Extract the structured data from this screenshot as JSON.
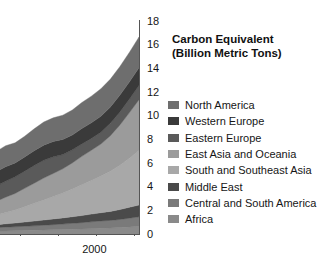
{
  "chart_data": {
    "type": "area",
    "stacked": true,
    "title": "Carbon Equivalent (Billion Metric Tons)",
    "title_line1": "Carbon Equivalent",
    "title_line2": "(Billion Metric Tons)",
    "xlabel": "",
    "ylabel": "Carbon Equivalent (Billion Metric Tons)",
    "ylim": [
      0,
      18
    ],
    "yticks": [
      0,
      2,
      4,
      6,
      8,
      10,
      12,
      14,
      16,
      18
    ],
    "ytick_labels": [
      "0",
      "2",
      "4",
      "6",
      "8",
      "10",
      "12",
      "14",
      "16",
      "18"
    ],
    "y_axis_position": "right",
    "xlim": [
      1970,
      2008
    ],
    "xticks": [
      1975,
      1983,
      1991,
      1999,
      2007
    ],
    "xtick_labels": [
      "",
      "",
      "",
      "2000",
      ""
    ],
    "x_labeled_tick": "2000",
    "grid": false,
    "legend_position": "right",
    "x": [
      1970,
      1972,
      1974,
      1976,
      1978,
      1980,
      1982,
      1984,
      1986,
      1988,
      1990,
      1992,
      1994,
      1996,
      1998,
      2000,
      2002,
      2004,
      2006,
      2008
    ],
    "series": [
      {
        "name": "Africa",
        "color": "#8a8a8a",
        "values": [
          0.15,
          0.17,
          0.19,
          0.21,
          0.24,
          0.26,
          0.28,
          0.3,
          0.32,
          0.34,
          0.36,
          0.38,
          0.4,
          0.42,
          0.45,
          0.48,
          0.51,
          0.55,
          0.6,
          0.65
        ]
      },
      {
        "name": "Central and South America",
        "color": "#7a7a7a",
        "values": [
          0.18,
          0.21,
          0.24,
          0.27,
          0.3,
          0.32,
          0.33,
          0.35,
          0.37,
          0.4,
          0.43,
          0.46,
          0.5,
          0.54,
          0.58,
          0.62,
          0.64,
          0.68,
          0.74,
          0.8
        ]
      },
      {
        "name": "Middle East",
        "color": "#4a4a4a",
        "values": [
          0.1,
          0.13,
          0.16,
          0.2,
          0.24,
          0.28,
          0.32,
          0.36,
          0.4,
          0.44,
          0.48,
          0.52,
          0.56,
          0.6,
          0.65,
          0.7,
          0.76,
          0.84,
          0.92,
          1.0
        ]
      },
      {
        "name": "South and Southeast Asia",
        "color": "#a8a8a8",
        "values": [
          0.35,
          0.45,
          0.55,
          0.68,
          0.82,
          0.95,
          1.1,
          1.3,
          1.5,
          1.7,
          1.9,
          2.1,
          2.35,
          2.6,
          2.85,
          3.1,
          3.4,
          3.75,
          4.15,
          4.6
        ]
      },
      {
        "name": "East Asia and Oceania",
        "color": "#9b9b9b",
        "values": [
          0.55,
          0.7,
          0.85,
          1.0,
          1.15,
          1.3,
          1.4,
          1.55,
          1.7,
          1.85,
          1.95,
          2.05,
          2.2,
          2.4,
          2.55,
          2.7,
          3.0,
          3.4,
          3.85,
          4.3
        ]
      },
      {
        "name": "Eastern Europe",
        "color": "#5a5a5a",
        "values": [
          0.9,
          1.0,
          1.1,
          1.2,
          1.3,
          1.35,
          1.4,
          1.45,
          1.5,
          1.5,
          1.4,
          1.2,
          1.1,
          1.05,
          1.0,
          1.0,
          1.05,
          1.1,
          1.15,
          1.2
        ]
      },
      {
        "name": "Western Europe",
        "color": "#3a3a3a",
        "values": [
          0.95,
          1.05,
          1.1,
          1.15,
          1.2,
          1.22,
          1.18,
          1.2,
          1.25,
          1.28,
          1.3,
          1.28,
          1.25,
          1.3,
          1.32,
          1.35,
          1.38,
          1.42,
          1.45,
          1.5
        ]
      },
      {
        "name": "North America",
        "color": "#6e6e6e",
        "values": [
          1.45,
          1.55,
          1.62,
          1.6,
          1.72,
          1.78,
          1.7,
          1.75,
          1.85,
          1.95,
          2.0,
          2.05,
          2.12,
          2.2,
          2.25,
          2.32,
          2.35,
          2.42,
          2.5,
          2.6
        ]
      }
    ],
    "stack_order_top_to_bottom": [
      "North America",
      "Western Europe",
      "Eastern Europe",
      "East Asia and Oceania",
      "South and Southeast Asia",
      "Middle East",
      "Central and South America",
      "Africa"
    ],
    "total_at_right_edge": 16.0
  },
  "legend": {
    "items": [
      {
        "label": "North America",
        "color": "#6e6e6e"
      },
      {
        "label": "Western Europe",
        "color": "#3a3a3a"
      },
      {
        "label": "Eastern Europe",
        "color": "#5a5a5a"
      },
      {
        "label": "East Asia and Oceania",
        "color": "#9b9b9b"
      },
      {
        "label": "South and Southeast Asia",
        "color": "#a8a8a8"
      },
      {
        "label": "Middle East",
        "color": "#4a4a4a"
      },
      {
        "label": "Central and South America",
        "color": "#7a7a7a"
      },
      {
        "label": "Africa",
        "color": "#8a8a8a"
      }
    ]
  },
  "colors": {
    "background": "#ffffff",
    "axis": "#555555",
    "text": "#161616"
  }
}
